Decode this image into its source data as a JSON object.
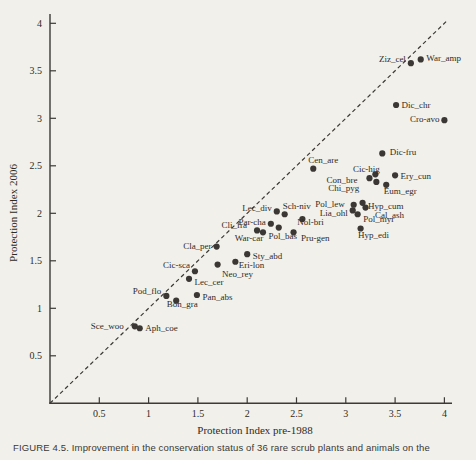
{
  "figure": {
    "caption": "FIGURE 4.5. Improvement in the conservation status of 36 rare scrub plants and animals on the"
  },
  "chart_data": {
    "type": "scatter",
    "title": "",
    "xlabel": "Protection Index pre-1988",
    "ylabel": "Protection Index 2006",
    "xlim": [
      0,
      4.1
    ],
    "ylim": [
      0,
      4.1
    ],
    "xticks": [
      0.5,
      1,
      1.5,
      2,
      2.5,
      3,
      3.5,
      4
    ],
    "yticks": [
      0.5,
      1,
      1.5,
      2,
      2.5,
      3,
      3.5,
      4
    ],
    "grid": false,
    "point_color": "#3b3734",
    "axis_color": "#3c3936",
    "reference_line": {
      "style": "dashed",
      "from": [
        0,
        0
      ],
      "to": [
        4.03,
        4.03
      ],
      "meaning": "y = x (no change)"
    },
    "points": [
      {
        "id": "Ziz_cel",
        "x": 3.66,
        "y": 3.58,
        "pos": "left",
        "dy": -4
      },
      {
        "id": "War_amp",
        "x": 3.76,
        "y": 3.62,
        "pos": "right",
        "dy": -1
      },
      {
        "id": "Dic_chr",
        "x": 3.51,
        "y": 3.14,
        "pos": "right"
      },
      {
        "id": "Cro-avo",
        "x": 4.0,
        "y": 2.98,
        "pos": "left",
        "dy": -1
      },
      {
        "id": "Dic-fru",
        "x": 3.37,
        "y": 2.63,
        "pos": "right",
        "dx": 2,
        "dy": -1
      },
      {
        "id": "Cen_are",
        "x": 2.67,
        "y": 2.47,
        "pos": "above",
        "dx": 10
      },
      {
        "id": "Cic-hig",
        "x": 3.3,
        "y": 2.41,
        "pos": "above",
        "dx": -9,
        "dy": 3
      },
      {
        "id": "Ery_cun",
        "x": 3.5,
        "y": 2.4,
        "pos": "right",
        "dy": 1
      },
      {
        "id": "Con_bre",
        "x": 3.24,
        "y": 2.37,
        "pos": "left",
        "dx": -7,
        "dy": 2
      },
      {
        "id": "Chi_pyg",
        "x": 3.31,
        "y": 2.33,
        "pos": "left",
        "dx": -12,
        "dy": 6
      },
      {
        "id": "Eum_egr",
        "x": 3.41,
        "y": 2.3,
        "pos": "below",
        "dx": 14,
        "dy": -2
      },
      {
        "id": "Hyp_cum",
        "x": 3.17,
        "y": 2.11,
        "pos": "right",
        "dy": 3
      },
      {
        "id": "Pol_lew",
        "x": 3.08,
        "y": 2.09,
        "pos": "left",
        "dx": -4,
        "dy": -1
      },
      {
        "id": "Cal_ash",
        "x": 3.2,
        "y": 2.06,
        "pos": "right",
        "dx": 4,
        "dy": 7
      },
      {
        "id": "Lia_ohl",
        "x": 3.07,
        "y": 2.03,
        "pos": "left",
        "dy": 3
      },
      {
        "id": "Pol_myr",
        "x": 3.12,
        "y": 1.99,
        "pos": "right",
        "dy": 5
      },
      {
        "id": "Hyp_edi",
        "x": 3.15,
        "y": 1.84,
        "pos": "below",
        "dx": 13,
        "dy": -2
      },
      {
        "id": "Lec_div",
        "x": 2.3,
        "y": 2.02,
        "pos": "left",
        "dy": -3
      },
      {
        "id": "Sch-niv",
        "x": 2.38,
        "y": 1.99,
        "pos": "above",
        "dx": 12
      },
      {
        "id": "Par-cha",
        "x": 2.24,
        "y": 1.89,
        "pos": "left",
        "dy": -2
      },
      {
        "id": "Pol_bas",
        "x": 2.32,
        "y": 1.85,
        "pos": "below",
        "dx": 4
      },
      {
        "id": "Cli_fra",
        "x": 2.1,
        "y": 1.82,
        "pos": "left",
        "dx": -5,
        "dy": -5
      },
      {
        "id": "War-car",
        "x": 2.16,
        "y": 1.8,
        "pos": "below",
        "dx": -14,
        "dy": -2
      },
      {
        "id": "Nol-bri",
        "x": 2.56,
        "y": 1.94,
        "pos": "below",
        "dx": 8,
        "dy": -5
      },
      {
        "id": "Pru-gen",
        "x": 2.47,
        "y": 1.8,
        "pos": "right",
        "dx": 2,
        "dy": 6
      },
      {
        "id": "Cla_per",
        "x": 1.69,
        "y": 1.65,
        "pos": "left",
        "dy": -1
      },
      {
        "id": "Sty_abd",
        "x": 2.0,
        "y": 1.57,
        "pos": "right",
        "dy": 2
      },
      {
        "id": "Eri-lon",
        "x": 1.88,
        "y": 1.49,
        "pos": "right",
        "dx": -2,
        "dy": 3
      },
      {
        "id": "Neo_rey",
        "x": 1.7,
        "y": 1.46,
        "pos": "below",
        "dx": 20,
        "dy": 1
      },
      {
        "id": "Cic-sca",
        "x": 1.47,
        "y": 1.39,
        "pos": "left",
        "dy": -6
      },
      {
        "id": "Lec_cer",
        "x": 1.41,
        "y": 1.31,
        "pos": "right",
        "dy": 3
      },
      {
        "id": "Pod_flo",
        "x": 1.18,
        "y": 1.13,
        "pos": "left",
        "dy": -5
      },
      {
        "id": "Pan_abs",
        "x": 1.49,
        "y": 1.14,
        "pos": "right",
        "dy": 2
      },
      {
        "id": "Bon_gra",
        "x": 1.28,
        "y": 1.08,
        "pos": "below",
        "dx": 6,
        "dy": -5
      },
      {
        "id": "Sce_woo",
        "x": 0.86,
        "y": 0.81,
        "pos": "left",
        "dx": -6
      },
      {
        "id": "Aph_coe",
        "x": 0.91,
        "y": 0.79,
        "pos": "right"
      }
    ]
  }
}
